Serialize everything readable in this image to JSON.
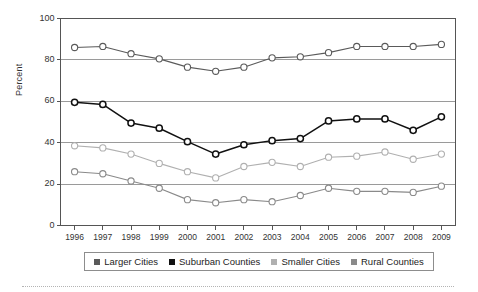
{
  "chart_data": {
    "type": "line",
    "title": "",
    "xlabel": "",
    "ylabel": "Percent",
    "categories": [
      "1996",
      "1997",
      "1998",
      "1999",
      "2000",
      "2001",
      "2002",
      "2003",
      "2004",
      "2005",
      "2006",
      "2007",
      "2008",
      "2009"
    ],
    "x": [
      1996,
      1997,
      1998,
      1999,
      2000,
      2001,
      2002,
      2003,
      2004,
      2005,
      2006,
      2007,
      2008,
      2009
    ],
    "ylim": [
      0,
      100
    ],
    "yticks": [
      0,
      20,
      40,
      60,
      80,
      100
    ],
    "grid": "horizontal",
    "legend_position": "bottom",
    "series": [
      {
        "name": "Larger Cities",
        "color": "#5a5a5a",
        "values": [
          86,
          86.5,
          83,
          80.5,
          76.5,
          74.5,
          76.5,
          81,
          81.5,
          83.5,
          86.5,
          86.5,
          86.5,
          87.5
        ]
      },
      {
        "name": "Suburban Counties",
        "color": "#111111",
        "values": [
          59.5,
          58.5,
          49.5,
          47,
          40.5,
          34.5,
          39,
          41,
          42,
          50.5,
          51.5,
          51.5,
          46,
          52.5
        ]
      },
      {
        "name": "Smaller Cities",
        "color": "#b0b0b0",
        "values": [
          38.5,
          37.5,
          34.5,
          30,
          26,
          23,
          28.5,
          30.5,
          28.5,
          33,
          33.5,
          35.5,
          32,
          34.5
        ]
      },
      {
        "name": "Rural Counties",
        "color": "#8a8a8a",
        "values": [
          26,
          25,
          21.5,
          18,
          12.5,
          11,
          12.5,
          11.5,
          14.5,
          18,
          16.5,
          16.5,
          16,
          19
        ]
      }
    ]
  },
  "axis": {
    "ylabel": "Percent",
    "ytick_labels": [
      "100",
      "80",
      "60",
      "40",
      "20",
      "0"
    ],
    "xtick_labels": [
      "1996",
      "1997",
      "1998",
      "1999",
      "2000",
      "2001",
      "2002",
      "2003",
      "2004",
      "2005",
      "2006",
      "2007",
      "2008",
      "2009"
    ]
  },
  "legend": {
    "entries": [
      {
        "label": "Larger Cities",
        "color": "#5a5a5a"
      },
      {
        "label": "Suburban Counties",
        "color": "#111111"
      },
      {
        "label": "Smaller Cities",
        "color": "#b0b0b0"
      },
      {
        "label": "Rural Counties",
        "color": "#8a8a8a"
      }
    ]
  }
}
